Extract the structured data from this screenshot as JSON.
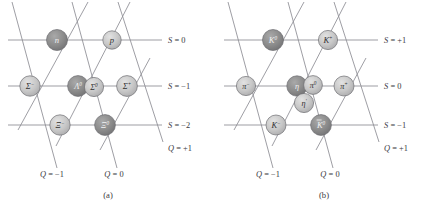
{
  "figure": {
    "background": "#ffffff",
    "line_color": "#8d8d93",
    "text_color": "#39393d"
  },
  "panels": [
    {
      "id": "a",
      "caption": "(a)",
      "name": "baryon-octet-diagram",
      "node_fill_dark": "#8a8a8a",
      "node_fill_light": "#c6c6c6",
      "node_stroke": "#6e6e72",
      "nodes": [
        {
          "id": "n",
          "name": "node-neutron",
          "symbol": "n",
          "sup": "",
          "cx": 57,
          "cy": 40,
          "r": 10.5,
          "shade": "dark",
          "font": 8.6,
          "italic": false
        },
        {
          "id": "p",
          "name": "node-proton",
          "symbol": "p",
          "sup": "",
          "cx": 112,
          "cy": 40,
          "r": 9.2,
          "shade": "light",
          "font": 8.6,
          "italic": false
        },
        {
          "id": "sigma-",
          "name": "node-sigma-minus",
          "symbol": "Σ",
          "sup": "−",
          "cx": 30,
          "cy": 86,
          "r": 10.2,
          "shade": "light",
          "font": 8.4,
          "italic": true
        },
        {
          "id": "lambda0",
          "name": "node-lambda-zero",
          "symbol": "Λ",
          "sup": "0",
          "cx": 78,
          "cy": 86,
          "r": 10.4,
          "shade": "dark",
          "font": 8.4,
          "italic": true
        },
        {
          "id": "sigma0",
          "name": "node-sigma-zero",
          "symbol": "Σ",
          "sup": "0",
          "cx": 94,
          "cy": 87,
          "r": 9.6,
          "shade": "light",
          "font": 8.0,
          "italic": true
        },
        {
          "id": "sigma+",
          "name": "node-sigma-plus",
          "symbol": "Σ",
          "sup": "+",
          "cx": 127,
          "cy": 86,
          "r": 10.4,
          "shade": "light",
          "font": 8.4,
          "italic": true
        },
        {
          "id": "xi-",
          "name": "node-xi-minus",
          "symbol": "Ξ",
          "sup": "−",
          "cx": 60,
          "cy": 125,
          "r": 10.2,
          "shade": "light",
          "font": 8.4,
          "italic": true
        },
        {
          "id": "xi0",
          "name": "node-xi-zero",
          "symbol": "Ξ",
          "sup": "0",
          "cx": 105,
          "cy": 125,
          "r": 10.4,
          "shade": "dark",
          "font": 8.4,
          "italic": true
        }
      ],
      "s_labels": [
        {
          "name": "s-label-0",
          "text": "S = 0",
          "var": "S",
          "value": "= 0",
          "x": 168,
          "y": 40
        },
        {
          "name": "s-label-minus1",
          "text": "S = −1",
          "var": "S",
          "value": "= −1",
          "x": 168,
          "y": 86
        },
        {
          "name": "s-label-minus2",
          "text": "S = −2",
          "var": "S",
          "value": "= −2",
          "x": 168,
          "y": 125
        }
      ],
      "q_labels": [
        {
          "name": "q-label-minus1",
          "var": "Q",
          "value": "= −1",
          "x": 52,
          "y": 174,
          "anchor": "middle"
        },
        {
          "name": "q-label-0",
          "var": "Q",
          "value": "= 0",
          "x": 114,
          "y": 174,
          "anchor": "middle"
        },
        {
          "name": "q-label-plus1",
          "var": "Q",
          "value": "= +1",
          "x": 168,
          "y": 148,
          "anchor": "start"
        }
      ]
    },
    {
      "id": "b",
      "caption": "(b)",
      "name": "meson-nonet-diagram",
      "node_fill_dark": "#8a8a8a",
      "node_fill_light": "#c6c6c6",
      "node_stroke": "#6e6e72",
      "nodes": [
        {
          "id": "k0",
          "name": "node-kaon-zero",
          "symbol": "K",
          "sup": "0",
          "cx": 57,
          "cy": 40,
          "r": 10.5,
          "shade": "dark",
          "font": 8.6,
          "italic": true
        },
        {
          "id": "k+",
          "name": "node-kaon-plus",
          "symbol": "K",
          "sup": "+",
          "cx": 112,
          "cy": 40,
          "r": 9.6,
          "shade": "light",
          "font": 8.6,
          "italic": true
        },
        {
          "id": "pi-",
          "name": "node-pion-minus",
          "symbol": "π",
          "sup": "−",
          "cx": 30,
          "cy": 86,
          "r": 9.6,
          "shade": "light",
          "font": 8.2,
          "italic": true
        },
        {
          "id": "eta",
          "name": "node-eta",
          "symbol": "η",
          "sup": "",
          "cx": 81,
          "cy": 86,
          "r": 10.2,
          "shade": "dark",
          "font": 8.2,
          "italic": true
        },
        {
          "id": "pi0",
          "name": "node-pion-zero",
          "symbol": "π",
          "sup": "0",
          "cx": 97,
          "cy": 85,
          "r": 9.4,
          "shade": "light",
          "font": 8.0,
          "italic": true
        },
        {
          "id": "etap",
          "name": "node-eta-prime",
          "symbol": "η",
          "sup": "′",
          "cx": 88,
          "cy": 103,
          "r": 9.6,
          "shade": "light",
          "font": 8.2,
          "italic": true
        },
        {
          "id": "pi+",
          "name": "node-pion-plus",
          "symbol": "π",
          "sup": "+",
          "cx": 128,
          "cy": 86,
          "r": 10.0,
          "shade": "light",
          "font": 8.2,
          "italic": true
        },
        {
          "id": "k-",
          "name": "node-kaon-minus",
          "symbol": "K",
          "sup": "−",
          "cx": 60,
          "cy": 125,
          "r": 10.0,
          "shade": "light",
          "font": 8.4,
          "italic": true
        },
        {
          "id": "k0bar",
          "name": "node-kaon-zero-bar",
          "symbol": "K",
          "sup": "0",
          "bar": true,
          "cx": 105,
          "cy": 125,
          "r": 10.4,
          "shade": "dark",
          "font": 8.4,
          "italic": true
        }
      ],
      "s_labels": [
        {
          "name": "s-label-plus1",
          "var": "S",
          "value": "= +1",
          "x": 168,
          "y": 40
        },
        {
          "name": "s-label-0",
          "var": "S",
          "value": "= 0",
          "x": 168,
          "y": 86
        },
        {
          "name": "s-label-minus1",
          "var": "S",
          "value": "= −1",
          "x": 168,
          "y": 125
        }
      ],
      "q_labels": [
        {
          "name": "q-label-minus1",
          "var": "Q",
          "value": "= −1",
          "x": 52,
          "y": 174,
          "anchor": "middle"
        },
        {
          "name": "q-label-0",
          "var": "Q",
          "value": "= 0",
          "x": 114,
          "y": 174,
          "anchor": "middle"
        },
        {
          "name": "q-label-plus1",
          "var": "Q",
          "value": "= +1",
          "x": 168,
          "y": 148,
          "anchor": "start"
        }
      ]
    }
  ]
}
